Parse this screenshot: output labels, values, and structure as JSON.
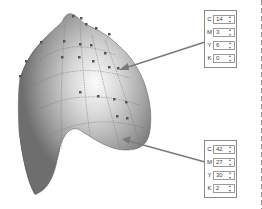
{
  "figure": {
    "colors": {
      "mesh_dark": "#5a5a5a",
      "mesh_light": "#f2f2f2",
      "panel_border": "#8a8a8a",
      "arrow": "#7a7a7a"
    }
  },
  "panels": [
    {
      "id": "top",
      "rows": [
        {
          "label": "C",
          "value": "14"
        },
        {
          "label": "M",
          "value": "3"
        },
        {
          "label": "Y",
          "value": "6"
        },
        {
          "label": "K",
          "value": "0"
        }
      ]
    },
    {
      "id": "bottom",
      "rows": [
        {
          "label": "C",
          "value": "42"
        },
        {
          "label": "M",
          "value": "27"
        },
        {
          "label": "Y",
          "value": "30"
        },
        {
          "label": "K",
          "value": "2"
        }
      ]
    }
  ]
}
